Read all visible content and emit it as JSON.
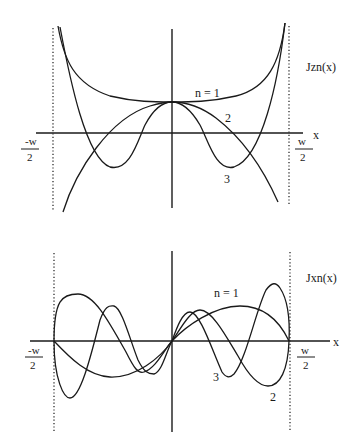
{
  "diagrams": [
    {
      "id": "top",
      "function_label": "Jzn(x)",
      "x_axis_label": "x",
      "left_bound": {
        "numerator": "-w",
        "denominator": "2"
      },
      "right_bound": {
        "numerator": "w",
        "denominator": "2"
      },
      "curve_labels": {
        "n1": "n = 1",
        "n2": "2",
        "n3": "3"
      }
    },
    {
      "id": "bottom",
      "function_label": "Jxn(x)",
      "x_axis_label": "x",
      "left_bound": {
        "numerator": "-w",
        "denominator": "2"
      },
      "right_bound": {
        "numerator": "w",
        "denominator": "2"
      },
      "curve_labels": {
        "n1": "n = 1",
        "n2": "2",
        "n3": "3"
      }
    }
  ]
}
